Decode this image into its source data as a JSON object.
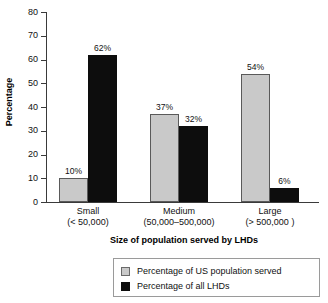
{
  "chart_data": {
    "type": "bar",
    "title": "",
    "subtitle": "",
    "xlabel": "Size of population served by LHDs",
    "ylabel": "Percentage",
    "ylim": [
      0,
      80
    ],
    "yticks": [
      0,
      10,
      20,
      30,
      40,
      50,
      60,
      70,
      80
    ],
    "ytick_labels": [
      "0",
      "10",
      "20",
      "30",
      "40",
      "50",
      "60",
      "70",
      "80"
    ],
    "grid": false,
    "legend_position": "bottom",
    "categories": [
      "Small",
      "Medium",
      "Large"
    ],
    "category_sublabels": [
      "(< 50,000)",
      "(50,000–500,000)",
      "(> 500,000 )"
    ],
    "series": [
      {
        "name": "Percentage of US population served",
        "color": "#c9c9c9",
        "values": [
          10,
          37,
          54
        ],
        "data_labels": [
          "10%",
          "37%",
          "54%"
        ]
      },
      {
        "name": "Percentage of all LHDs",
        "color": "#0d0d0d",
        "values": [
          62,
          32,
          6
        ],
        "data_labels": [
          "62%",
          "32%",
          "6%"
        ]
      }
    ]
  },
  "legend": {
    "items": [
      {
        "label": "Percentage of US population served",
        "swatch": "gray"
      },
      {
        "label": "Percentage of all LHDs",
        "swatch": "black"
      }
    ]
  },
  "axes": {
    "y_title": "Percentage",
    "x_title": "Size of population served by LHDs"
  }
}
